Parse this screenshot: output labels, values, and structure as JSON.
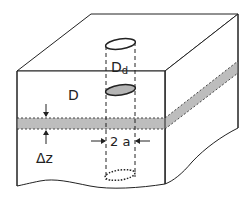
{
  "diagram": {
    "colors": {
      "line": "#222222",
      "band_fill": "#bdbdbd",
      "disk_fill": "#b5b5b5",
      "background": "#ffffff"
    },
    "labels": {
      "surface_disk": "D",
      "surface_disk_sub": "d",
      "depth": "D",
      "thickness": "Δz",
      "diameter": "2 a"
    }
  }
}
